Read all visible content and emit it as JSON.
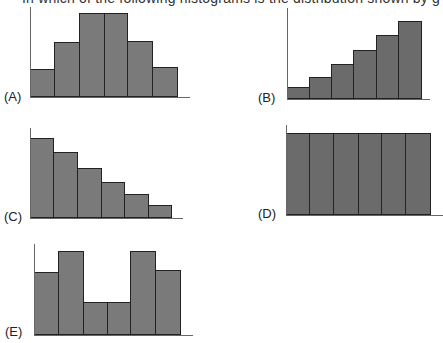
{
  "question": {
    "text": "In which of the following histograms is the distribution shown by g"
  },
  "chart_data": [
    {
      "type": "bar",
      "label": "(A)",
      "categories": [
        "1",
        "2",
        "3",
        "4",
        "5",
        "6"
      ],
      "values": [
        28,
        55,
        84,
        84,
        56,
        30
      ],
      "ylim": [
        0,
        90
      ],
      "grid": false
    },
    {
      "type": "bar",
      "label": "(B)",
      "categories": [
        "1",
        "2",
        "3",
        "4",
        "5",
        "6"
      ],
      "values": [
        12,
        22,
        35,
        48,
        63,
        77
      ],
      "ylim": [
        0,
        90
      ],
      "grid": false
    },
    {
      "type": "bar",
      "label": "(C)",
      "categories": [
        "1",
        "2",
        "3",
        "4",
        "5",
        "6"
      ],
      "values": [
        80,
        66,
        50,
        36,
        24,
        13
      ],
      "ylim": [
        0,
        90
      ],
      "grid": false
    },
    {
      "type": "bar",
      "label": "(D)",
      "categories": [
        "1",
        "2",
        "3",
        "4",
        "5",
        "6"
      ],
      "values": [
        82,
        82,
        82,
        82,
        82,
        82
      ],
      "ylim": [
        0,
        90
      ],
      "grid": false
    },
    {
      "type": "bar",
      "label": "(E)",
      "categories": [
        "1",
        "2",
        "3",
        "4",
        "5",
        "6"
      ],
      "values": [
        62,
        83,
        33,
        33,
        83,
        64
      ],
      "ylim": [
        0,
        90
      ],
      "grid": false
    }
  ],
  "layout": [
    {
      "axisX": 30,
      "axisTop": 7,
      "baseline": 97,
      "xEnd": 190,
      "edges": [
        30,
        54,
        79,
        104,
        127,
        152,
        177
      ],
      "labelX": 4,
      "labelY": 89
    },
    {
      "axisX": 287,
      "axisTop": 8,
      "baseline": 99,
      "xEnd": 430,
      "edges": [
        287,
        309,
        331,
        353,
        376,
        398,
        421
      ],
      "labelX": 258,
      "labelY": 90
    },
    {
      "axisX": 30,
      "axisTop": 128,
      "baseline": 218,
      "xEnd": 183,
      "edges": [
        30,
        53,
        77,
        101,
        124,
        148,
        171
      ],
      "labelX": 4,
      "labelY": 209
    },
    {
      "axisX": 286,
      "axisTop": 125,
      "baseline": 215,
      "xEnd": 443,
      "edges": [
        286,
        309,
        333,
        358,
        381,
        405,
        430
      ],
      "labelX": 258,
      "labelY": 206
    },
    {
      "axisX": 34,
      "axisTop": 244,
      "baseline": 335,
      "xEnd": 193,
      "edges": [
        34,
        58,
        83,
        107,
        130,
        155,
        180
      ],
      "labelX": 5,
      "labelY": 324
    }
  ]
}
